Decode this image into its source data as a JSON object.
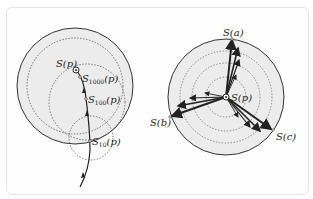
{
  "left_diagram": {
    "labels": {
      "sp": "S(p)",
      "s1000": "S",
      "s1000_sub": "1000",
      "s100": "S",
      "s100_sub": "100",
      "s10": "S",
      "s10_sub": "10",
      "arg": "(p)"
    }
  },
  "right_diagram": {
    "labels": {
      "sa": "S(a)",
      "sb": "S(b)",
      "sc": "S(c)",
      "sp": "S(p)"
    }
  },
  "colors": {
    "fill": "#ececec",
    "stroke": "#333333",
    "dashed": "#555555"
  }
}
